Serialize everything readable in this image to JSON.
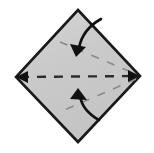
{
  "figure": {
    "width": 154,
    "height": 153,
    "background_color": "#ffffff"
  },
  "colors": {
    "paper_fill": "#c9c9c9",
    "paper_fill_light": "#d2d2d2",
    "paper_outline": "#1a1a1a",
    "fold_line": "#2b2b2b",
    "crease_line_faint": "#8a8a8a",
    "arrow": "#111111"
  },
  "shapes": {
    "paper": {
      "name": "diamond-paper",
      "description": "Square sheet rotated 45 degrees (diamond)",
      "points": "78,10 140,76 78,142 16,77",
      "stroke_width": 2.6
    },
    "fold_line_horizontal": {
      "name": "horizontal-fold-line",
      "description": "Dashed valley fold line running left vertex to right vertex",
      "x1": 20,
      "y1": 77,
      "x2": 136,
      "y2": 76,
      "dash": "9 8",
      "stroke_width": 2.4
    },
    "crease_upper_right": {
      "name": "upper-right-crease",
      "description": "Faint dashed crease from upper left area to right vertex",
      "x1": 60,
      "y1": 42,
      "x2": 136,
      "y2": 74,
      "dash": "8 9",
      "stroke_width": 1.6
    },
    "crease_lower_right": {
      "name": "lower-right-crease",
      "description": "Faint dashed crease from right vertex down-left",
      "x1": 136,
      "y1": 79,
      "x2": 60,
      "y2": 112,
      "dash": "8 9",
      "stroke_width": 1.6
    },
    "arrowhead_left": {
      "name": "left-fold-arrowhead",
      "description": "Arrowhead at left vertex pointing left along fold line",
      "points": "16,77 28,71 28,83"
    },
    "arrowhead_right": {
      "name": "right-fold-arrowhead",
      "description": "Arrowhead at right vertex pointing right along fold line",
      "points": "140,76 128,70 128,82"
    },
    "arrow_top": {
      "name": "top-curved-arrow",
      "description": "Curved arrow from upper right curving down-left, head pointing down-left",
      "path": "M 101 19 C 92 24, 82 32, 79 48",
      "head_points": "76,57 70,44 86,47",
      "stroke_width": 2.6
    },
    "arrow_bottom": {
      "name": "bottom-curved-arrow",
      "description": "Curved arrow from lower right curving up-left, head pointing up-left",
      "path": "M 99 120 C 90 115, 82 108, 80 96",
      "head_points": "78,88 87,100 70,99",
      "stroke_width": 2.6
    }
  },
  "labels": {
    "paper": "paper",
    "fold_line": "valley fold",
    "arrows": "fold direction"
  }
}
